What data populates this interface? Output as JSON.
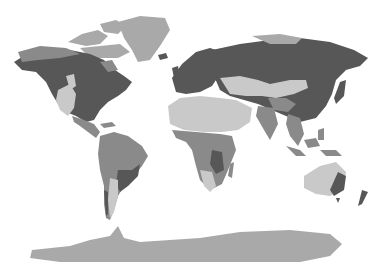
{
  "map": {
    "type": "world-climate-zones",
    "projection": "equirectangular-like",
    "style": "grayscale",
    "legend": [],
    "labels": [],
    "zone_colors": {
      "dark": "#575757",
      "medium": "#8a8a8a",
      "ice_tundra": "#a9a9a9",
      "light_arid": "#c9c9c9",
      "water": "#ffffff"
    },
    "regions": [
      {
        "name": "Greenland",
        "zone": "ice_tundra"
      },
      {
        "name": "Arctic Canada",
        "zone": "ice_tundra"
      },
      {
        "name": "North America boreal/temperate",
        "zone": "dark"
      },
      {
        "name": "North America western dry",
        "zone": "light_arid"
      },
      {
        "name": "Central America",
        "zone": "medium"
      },
      {
        "name": "South America tropical",
        "zone": "medium"
      },
      {
        "name": "South America southeast",
        "zone": "dark"
      },
      {
        "name": "Patagonia",
        "zone": "light_arid"
      },
      {
        "name": "Europe",
        "zone": "dark"
      },
      {
        "name": "Siberia",
        "zone": "dark"
      },
      {
        "name": "Arctic Russia",
        "zone": "ice_tundra"
      },
      {
        "name": "Sahara and Arabia",
        "zone": "light_arid"
      },
      {
        "name": "Central Asia desert",
        "zone": "light_arid"
      },
      {
        "name": "Sub-Saharan Africa",
        "zone": "medium"
      },
      {
        "name": "Southern Africa dry",
        "zone": "light_arid"
      },
      {
        "name": "South/Southeast Asia",
        "zone": "medium"
      },
      {
        "name": "East Asia",
        "zone": "dark"
      },
      {
        "name": "Australia interior",
        "zone": "light_arid"
      },
      {
        "name": "Australia east coast",
        "zone": "dark"
      },
      {
        "name": "New Zealand",
        "zone": "dark"
      },
      {
        "name": "Antarctica",
        "zone": "ice_tundra"
      }
    ]
  }
}
